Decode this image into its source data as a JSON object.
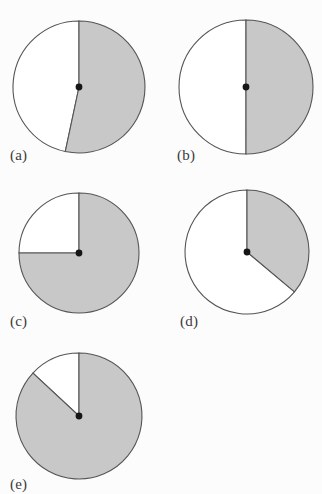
{
  "figure": {
    "background_color": "#fcfcfc",
    "shaded_color": "#c8c8c8",
    "outline_color": "#555555",
    "center_dot_color": "#161616",
    "label_color": "#3a3a3a"
  },
  "chart_data": [
    {
      "type": "pie",
      "id": "a",
      "label": "(a)",
      "title": "",
      "categories": [
        "shaded",
        "unshaded"
      ],
      "values": [
        53,
        47
      ],
      "start_angle_deg": 0,
      "shaded_sweep_deg": 192,
      "legend": "none",
      "grid": false,
      "center": [
        79,
        87
      ],
      "radius": 66,
      "label_pos": [
        10,
        147
      ]
    },
    {
      "type": "pie",
      "id": "b",
      "label": "(b)",
      "title": "",
      "categories": [
        "shaded",
        "unshaded"
      ],
      "values": [
        50,
        50
      ],
      "start_angle_deg": 0,
      "shaded_sweep_deg": 180,
      "legend": "none",
      "grid": false,
      "center": [
        246,
        87
      ],
      "radius": 67,
      "label_pos": [
        177,
        147
      ]
    },
    {
      "type": "pie",
      "id": "c",
      "label": "(c)",
      "title": "",
      "categories": [
        "shaded",
        "unshaded"
      ],
      "values": [
        75,
        25
      ],
      "start_angle_deg": 0,
      "shaded_sweep_deg": 270,
      "legend": "none",
      "grid": false,
      "center": [
        79,
        253
      ],
      "radius": 60,
      "label_pos": [
        10,
        313
      ]
    },
    {
      "type": "pie",
      "id": "d",
      "label": "(d)",
      "title": "",
      "categories": [
        "shaded",
        "unshaded"
      ],
      "values": [
        36,
        64
      ],
      "start_angle_deg": 0,
      "shaded_sweep_deg": 130,
      "legend": "none",
      "grid": false,
      "center": [
        247,
        252
      ],
      "radius": 62,
      "label_pos": [
        180,
        313
      ]
    },
    {
      "type": "pie",
      "id": "e",
      "label": "(e)",
      "title": "",
      "categories": [
        "shaded",
        "unshaded"
      ],
      "values": [
        87,
        13
      ],
      "start_angle_deg": 0,
      "shaded_sweep_deg": 313,
      "legend": "none",
      "grid": false,
      "center": [
        79,
        416
      ],
      "radius": 63,
      "label_pos": [
        10,
        476
      ]
    }
  ]
}
